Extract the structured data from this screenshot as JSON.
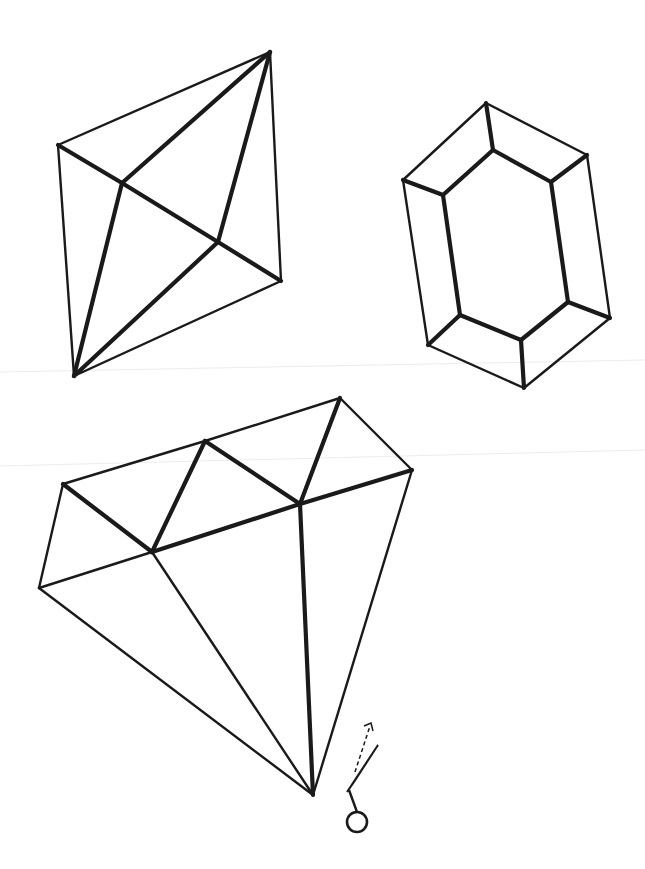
{
  "colors": {
    "background": "#ffffff",
    "stroke": "#1a1a1a"
  },
  "figures": [
    {
      "name": "octahedron-gem",
      "outline": [
        [
          270,
          52
        ],
        [
          58,
          145
        ],
        [
          74,
          376
        ],
        [
          281,
          281
        ]
      ],
      "thin_edges": [
        [
          [
            270,
            52
          ],
          [
            58,
            145
          ]
        ],
        [
          [
            58,
            145
          ],
          [
            74,
            376
          ]
        ],
        [
          [
            74,
            376
          ],
          [
            281,
            281
          ]
        ],
        [
          [
            281,
            281
          ],
          [
            270,
            52
          ]
        ]
      ],
      "thick_edges": [
        [
          [
            270,
            52
          ],
          [
            122,
            183
          ]
        ],
        [
          [
            270,
            52
          ],
          [
            218,
            242
          ]
        ],
        [
          [
            58,
            145
          ],
          [
            122,
            183
          ]
        ],
        [
          [
            122,
            183
          ],
          [
            218,
            242
          ]
        ],
        [
          [
            218,
            242
          ],
          [
            281,
            281
          ]
        ],
        [
          [
            122,
            183
          ],
          [
            74,
            376
          ]
        ],
        [
          [
            218,
            242
          ],
          [
            74,
            376
          ]
        ]
      ]
    },
    {
      "name": "emerald-cut-gem",
      "outer": [
        [
          486,
          103
        ],
        [
          587,
          155
        ],
        [
          610,
          318
        ],
        [
          524,
          388
        ],
        [
          428,
          345
        ],
        [
          403,
          180
        ]
      ],
      "inner": [
        [
          493,
          150
        ],
        [
          551,
          182
        ],
        [
          568,
          302
        ],
        [
          521,
          340
        ],
        [
          460,
          315
        ],
        [
          443,
          195
        ]
      ]
    },
    {
      "name": "diamond-gem",
      "thin_edges": [
        [
          [
            63,
            484
          ],
          [
            205,
            441
          ]
        ],
        [
          [
            205,
            441
          ],
          [
            340,
            398
          ]
        ],
        [
          [
            340,
            398
          ],
          [
            412,
            470
          ]
        ],
        [
          [
            63,
            484
          ],
          [
            39,
            588
          ]
        ],
        [
          [
            39,
            588
          ],
          [
            152,
            552
          ]
        ],
        [
          [
            39,
            588
          ],
          [
            313,
            795
          ]
        ],
        [
          [
            412,
            470
          ],
          [
            313,
            795
          ]
        ],
        [
          [
            152,
            552
          ],
          [
            313,
            795
          ]
        ]
      ],
      "thick_edges": [
        [
          [
            63,
            484
          ],
          [
            152,
            552
          ]
        ],
        [
          [
            152,
            552
          ],
          [
            205,
            441
          ]
        ],
        [
          [
            205,
            441
          ],
          [
            300,
            504
          ]
        ],
        [
          [
            300,
            504
          ],
          [
            340,
            398
          ]
        ],
        [
          [
            152,
            552
          ],
          [
            300,
            504
          ]
        ],
        [
          [
            300,
            504
          ],
          [
            412,
            470
          ]
        ],
        [
          [
            300,
            504
          ],
          [
            313,
            795
          ]
        ]
      ]
    }
  ],
  "cut_marker": {
    "name": "cut-here-marker",
    "ring_center": [
      357,
      822
    ],
    "ring_radius": 10
  }
}
